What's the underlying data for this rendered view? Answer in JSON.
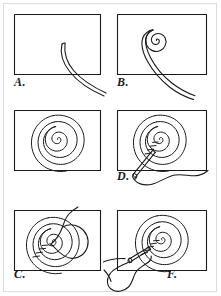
{
  "document": {
    "kind": "instructional-diagram",
    "title": "Coiled spiral stitching steps",
    "ink_color": "#1a1a1a",
    "paper_color": "#ffffff",
    "border_color": "#dcdcdc"
  },
  "panels": [
    {
      "id": "a",
      "label": "A.",
      "step": 1,
      "content": "a single long cord or strand lying loose, curving from inside the frame down past the lower right corner",
      "frame": {
        "x": 14,
        "y": 14,
        "w": 86,
        "h": 60
      }
    },
    {
      "id": "b",
      "label": "B.",
      "step": 2,
      "content": "the free end of the cord wound into a small tight spiral of about two and a half turns at the centre, tail running down out of the frame",
      "frame": {
        "x": 117,
        "y": 14,
        "w": 89,
        "h": 60
      }
    },
    {
      "id": "c",
      "label": "C.",
      "step": 3,
      "content": "the cord fully coiled into a flat round spiral of about nine concentric turns filling the frame",
      "frame": {
        "x": 14,
        "y": 110,
        "w": 86,
        "h": 60
      }
    },
    {
      "id": "d",
      "label": "D.",
      "step": 4,
      "content": "a threaded needle brought up from below the coil, stitching across the coil rings with a trailing wavy thread",
      "frame": {
        "x": 117,
        "y": 110,
        "w": 89,
        "h": 60
      }
    },
    {
      "id": "e",
      "label": "E.",
      "step": 5,
      "content": "the thread carried over the top of the coil forming a large looping stitch around the right side",
      "frame": {
        "x": 14,
        "y": 206,
        "w": 86,
        "h": 60
      }
    },
    {
      "id": "f",
      "label": "F.",
      "step": 6,
      "content": "the needle pulled back out at the left with the slack thread looping beneath the coil, stitches radiating toward the centre",
      "frame": {
        "x": 117,
        "y": 206,
        "w": 89,
        "h": 60
      }
    }
  ]
}
